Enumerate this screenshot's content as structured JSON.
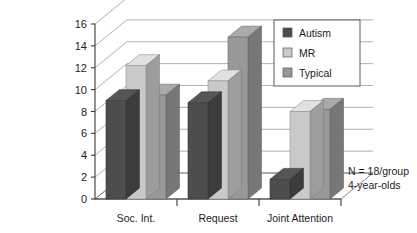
{
  "chart_data": {
    "type": "bar",
    "title": "",
    "subtitle": "",
    "xlabel": "",
    "ylabel": "",
    "categories": [
      "Soc. Int.",
      "Request",
      "Joint Attention"
    ],
    "series": [
      {
        "name": "Autism",
        "color": "#4d4d4d",
        "values": [
          9.0,
          8.8,
          1.8
        ]
      },
      {
        "name": "MR",
        "color": "#c9c9c9",
        "values": [
          12.2,
          10.8,
          8.0
        ]
      },
      {
        "name": "Typical",
        "color": "#989898",
        "values": [
          9.5,
          14.8,
          8.2
        ]
      }
    ],
    "ylim": [
      0,
      16
    ],
    "yticks": [
      0,
      2,
      4,
      6,
      8,
      10,
      12,
      14,
      16
    ],
    "ytick_labels": [
      "0",
      "2",
      "4",
      "6",
      "8",
      "10",
      "12",
      "14",
      "16"
    ],
    "grid": true,
    "legend_position": "top-right",
    "three_d": true
  },
  "legend": {
    "items": [
      {
        "label": "Autism",
        "swatch": "#4d4d4d"
      },
      {
        "label": "MR",
        "swatch": "#c9c9c9"
      },
      {
        "label": "Typical",
        "swatch": "#989898"
      }
    ]
  },
  "annotations": {
    "line1": "N = 18/group",
    "line2": "4-year-olds"
  },
  "axis": {
    "y_tick_labels": [
      "16",
      "14",
      "12",
      "10",
      "8",
      "6",
      "4",
      "2",
      "0"
    ],
    "x_tick_labels": [
      "Soc. Int.",
      "Request",
      "Joint Attention"
    ]
  }
}
